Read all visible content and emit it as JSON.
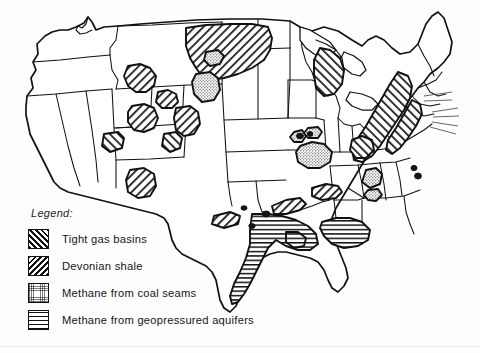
{
  "figure": {
    "style": "black-and-white line map with hatch-pattern resource overlays",
    "background_color": "#ffffff",
    "line_color": "#111111"
  },
  "legend": {
    "heading": "Legend:",
    "items": [
      {
        "key": "tight-gas-basins",
        "label": "Tight gas basins",
        "pattern": "diagonal-hatch-forward",
        "color": "#111111"
      },
      {
        "key": "devonian-shale",
        "label": "Devonian shale",
        "pattern": "diagonal-hatch-backward",
        "color": "#111111"
      },
      {
        "key": "coal-seams",
        "label": "Methane from coal seams",
        "pattern": "stipple",
        "color": "#111111"
      },
      {
        "key": "geopressured",
        "label": "Methane from geopressured aquifers",
        "pattern": "horizontal-lines",
        "color": "#111111"
      }
    ]
  },
  "regions": [
    {
      "name": "Montana–Dakotas tight gas",
      "category": "tight-gas-basins"
    },
    {
      "name": "Green River Basin",
      "category": "tight-gas-basins"
    },
    {
      "name": "Wind River Basin",
      "category": "tight-gas-basins"
    },
    {
      "name": "Powder River Basin",
      "category": "coal-seams"
    },
    {
      "name": "Uinta–Piceance Basin",
      "category": "tight-gas-basins"
    },
    {
      "name": "San Juan Basin",
      "category": "tight-gas-basins"
    },
    {
      "name": "Denver Basin",
      "category": "devonian-shale"
    },
    {
      "name": "Michigan Basin",
      "category": "devonian-shale"
    },
    {
      "name": "Appalachian Basin",
      "category": "devonian-shale"
    },
    {
      "name": "Illinois Basin",
      "category": "coal-seams"
    },
    {
      "name": "Arkoma / Anadarko",
      "category": "tight-gas-basins"
    },
    {
      "name": "Gulf Coast aquifer belt",
      "category": "geopressured"
    }
  ]
}
